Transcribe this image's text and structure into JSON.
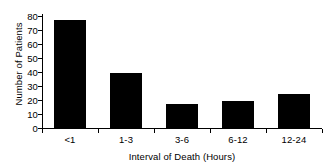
{
  "chart_data": {
    "type": "bar",
    "title": "",
    "categories": [
      "<1",
      "1-3",
      "3-6",
      "6-12",
      "12-24"
    ],
    "values": [
      77,
      39,
      17,
      19,
      24
    ],
    "xlabel": "Interval of Death (Hours)",
    "ylabel": "Number of Patients",
    "ylim": [
      0,
      80
    ],
    "yticks": [
      0,
      10,
      20,
      30,
      40,
      50,
      60,
      70,
      80
    ],
    "ytick_labels": [
      "0",
      "10",
      "20",
      "30",
      "40",
      "50",
      "60",
      "70",
      "80"
    ],
    "grid": false,
    "legend": null,
    "bar_color": "#000000",
    "axis_color": "#000000",
    "background_color": "#ffffff"
  }
}
